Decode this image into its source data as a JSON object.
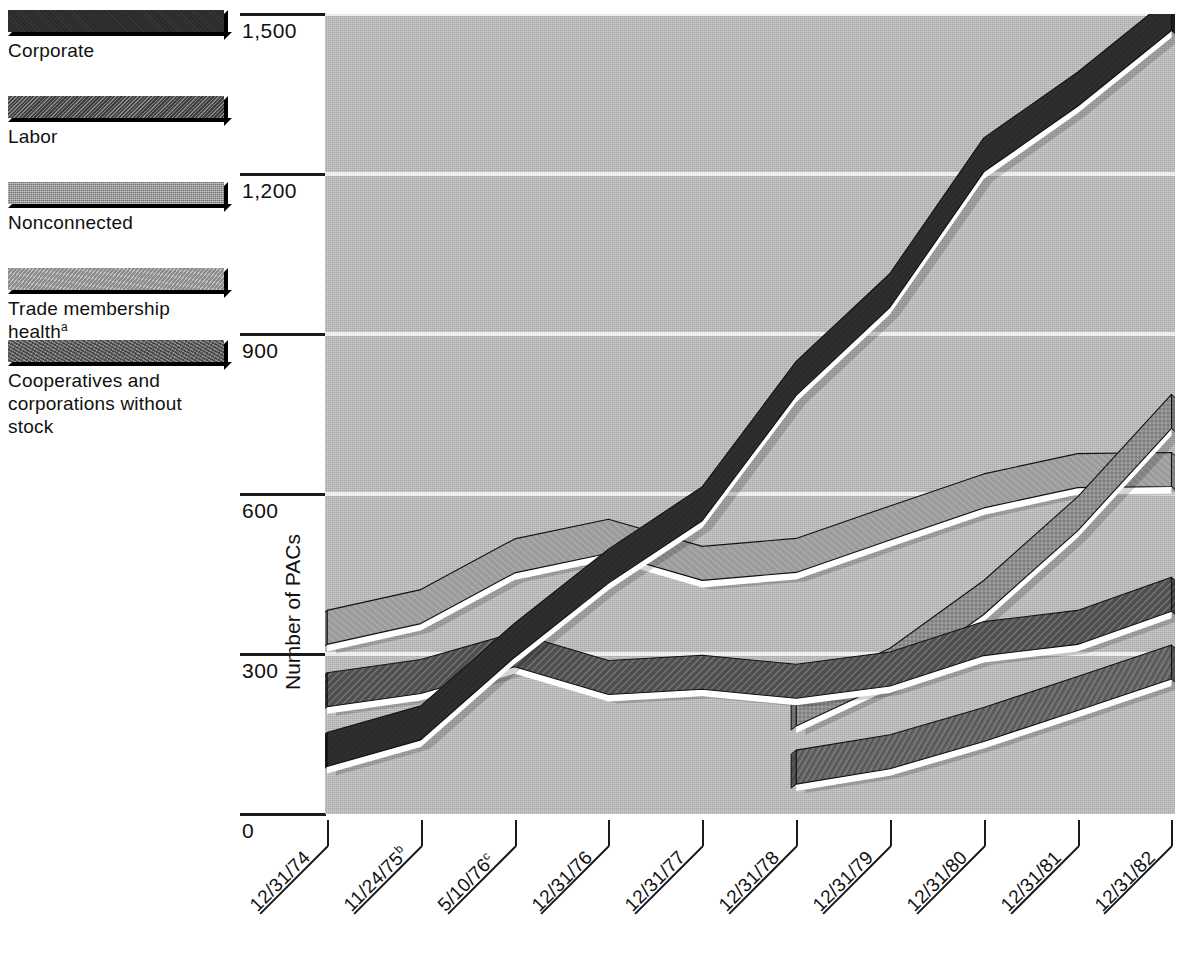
{
  "legend": {
    "items": [
      {
        "label": "Corporate",
        "key": "corporate",
        "swatch_icon": "legend-swatch-corporate",
        "color": "#2b2b2b"
      },
      {
        "label": "Labor",
        "key": "labor",
        "swatch_icon": "legend-swatch-labor",
        "color": "#545454"
      },
      {
        "label": "Nonconnected",
        "key": "nonconnected",
        "swatch_icon": "legend-swatch-nonconnected",
        "color": "#8d8d8d"
      },
      {
        "label": "Trade membership health",
        "key": "trade",
        "swatch_icon": "legend-swatch-trade",
        "color": "#9c9c9c",
        "superscript": "a"
      },
      {
        "label": "Cooperatives and corporations without stock",
        "key": "coop",
        "swatch_icon": "legend-swatch-coop",
        "color": "#6a6a6a"
      }
    ]
  },
  "axis": {
    "ylabel": "Number of PACs",
    "yticks": [
      "0",
      "300",
      "600",
      "900",
      "1,200",
      "1,500"
    ],
    "ytick_values": [
      0,
      300,
      600,
      900,
      1200,
      1500
    ],
    "xticks": [
      {
        "text": "12/31/74",
        "superscript": ""
      },
      {
        "text": "11/24/75",
        "superscript": "b"
      },
      {
        "text": "5/10/76",
        "superscript": "c"
      },
      {
        "text": "12/31/76",
        "superscript": ""
      },
      {
        "text": "12/31/77",
        "superscript": ""
      },
      {
        "text": "12/31/78",
        "superscript": ""
      },
      {
        "text": "12/31/79",
        "superscript": ""
      },
      {
        "text": "12/31/80",
        "superscript": ""
      },
      {
        "text": "12/31/81",
        "superscript": ""
      },
      {
        "text": "12/31/82",
        "superscript": ""
      }
    ]
  },
  "chart_data": {
    "type": "line",
    "title": "",
    "xlabel": "",
    "ylabel": "Number of PACs",
    "ylim": [
      0,
      1500
    ],
    "grid": true,
    "legend_position": "left",
    "categories": [
      "12/31/74",
      "11/24/75",
      "5/10/76",
      "12/31/76",
      "12/31/77",
      "12/31/78",
      "12/31/79",
      "12/31/80",
      "12/31/81",
      "12/31/82"
    ],
    "series": [
      {
        "name": "Corporate",
        "color": "#2b2b2b",
        "values": [
          89,
          139,
          294,
          433,
          550,
          785,
          950,
          1204,
          1327,
          1469
        ]
      },
      {
        "name": "Labor",
        "color": "#545454",
        "values": [
          201,
          226,
          276,
          224,
          234,
          217,
          240,
          297,
          318,
          380
        ]
      },
      {
        "name": "Nonconnected",
        "color": "#8d8d8d",
        "values": [
          null,
          null,
          null,
          null,
          null,
          165,
          247,
          374,
          531,
          723
        ]
      },
      {
        "name": "Trade membership health",
        "color": "#9c9c9c",
        "values": [
          318,
          357,
          452,
          489,
          438,
          453,
          514,
          574,
          612,
          614
        ]
      },
      {
        "name": "Cooperatives and corporations without stock",
        "color": "#6a6a6a",
        "values": [
          null,
          null,
          null,
          null,
          null,
          56,
          85,
          136,
          194,
          253
        ]
      }
    ]
  }
}
